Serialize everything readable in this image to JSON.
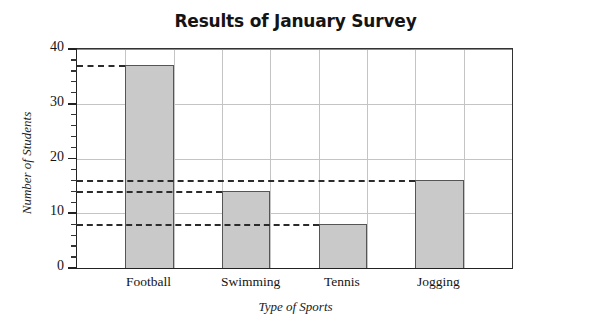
{
  "chart_data": {
    "type": "bar",
    "title": "Results of January Survey",
    "xlabel": "Type of Sports",
    "ylabel": "Number of Students",
    "categories": [
      "Football",
      "Swimming",
      "Tennis",
      "Jogging"
    ],
    "values": [
      37,
      14,
      8,
      16
    ],
    "ylim": [
      0,
      40
    ],
    "ytick_labels": [
      "0",
      "10",
      "20",
      "30",
      "40"
    ],
    "ytick_values": [
      0,
      10,
      20,
      30,
      40
    ],
    "yminor_step": 2,
    "grid": "both",
    "legend": "none",
    "bar_fill_color": "#c9c9c9",
    "bar_edge_color": "#555555",
    "gridline_color": "#c4c4c4",
    "axis_color": "#222222",
    "reference_lines": [
      {
        "value": 37,
        "label": "Football level",
        "extends_to": "Football"
      },
      {
        "value": 16,
        "label": "Jogging level",
        "extends_to": "Jogging"
      },
      {
        "value": 14,
        "label": "Swimming level",
        "extends_to": "Swimming"
      },
      {
        "value": 8,
        "label": "Tennis level",
        "extends_to": "Tennis"
      }
    ]
  }
}
